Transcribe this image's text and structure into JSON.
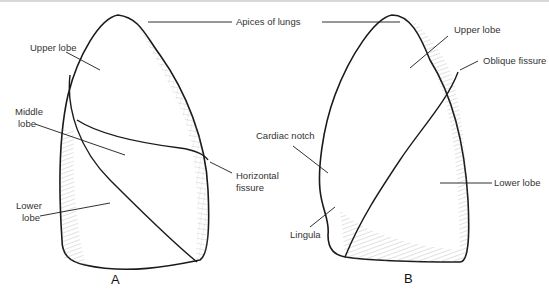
{
  "figure": {
    "panel_a": {
      "caption": "A",
      "labels": {
        "upper_lobe": "Upper lobe",
        "middle_lobe_1": "Middle",
        "middle_lobe_2": "lobe",
        "lower_lobe_1": "Lower",
        "lower_lobe_2": "lobe",
        "horizontal_fissure_1": "Horizontal",
        "horizontal_fissure_2": "fissure"
      }
    },
    "shared": {
      "apices": "Apices of lungs"
    },
    "panel_b": {
      "caption": "B",
      "labels": {
        "upper_lobe": "Upper lobe",
        "oblique_fissure": "Oblique fissure",
        "cardiac_notch": "Cardiac notch",
        "lower_lobe": "Lower lobe",
        "lingula": "Lingula"
      }
    },
    "colors": {
      "line": "#1a1a1a",
      "hatch": "#666666",
      "text": "#333333"
    }
  }
}
